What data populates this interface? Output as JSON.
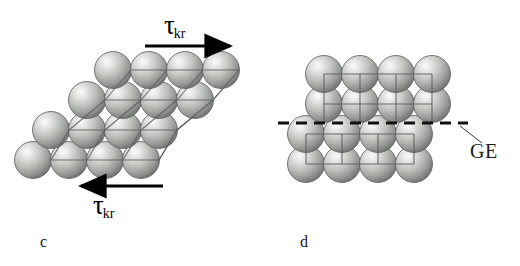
{
  "figure": {
    "background_color": "#ffffff",
    "width": 520,
    "height": 266
  },
  "panels": [
    {
      "id": "c",
      "label": "c",
      "caption_position": "bottom-left",
      "description": "sheared crystal lattice under critical shear stress",
      "arrows": [
        {
          "name": "shear-arrow-top",
          "direction": "right",
          "x1": 145,
          "y1": 46,
          "x2": 235,
          "y2": 46,
          "color": "#000000"
        },
        {
          "name": "shear-arrow-bottom",
          "direction": "left",
          "x1": 163,
          "y1": 186,
          "x2": 76,
          "y2": 186,
          "color": "#000000"
        }
      ],
      "annotations": [
        {
          "name": "tau-top",
          "symbol": "τ",
          "subscript": "kr"
        },
        {
          "name": "tau-bottom",
          "symbol": "τ",
          "subscript": "kr"
        }
      ]
    },
    {
      "id": "d",
      "label": "d",
      "caption_position": "bottom-left",
      "description": "offset lattice halves separated by a grain boundary",
      "annotations": [
        {
          "name": "grain-boundary",
          "label": "GE"
        }
      ],
      "boundary_line": {
        "name": "grain-boundary-line",
        "style": "dashed",
        "x1": 18,
        "y1": 123,
        "x2": 208,
        "y2": 123,
        "color": "#111111"
      },
      "leader_line": {
        "x1": 200,
        "y1": 126,
        "x2": 222,
        "y2": 143
      }
    }
  ],
  "sphere_style": {
    "diameter": 37,
    "highlight_color": "#f2f2f0",
    "mid_color": "#b6b8b4",
    "edge_color": "#6e7070",
    "outline_color": "#5a5c5c"
  },
  "lattice_c": {
    "rows": [
      {
        "index": 0,
        "y": 160,
        "x_start": 33,
        "count": 4,
        "step": 36
      },
      {
        "index": 1,
        "y": 130,
        "x_start": 51,
        "count": 4,
        "step": 36
      },
      {
        "index": 2,
        "y": 100,
        "x_start": 87,
        "count": 4,
        "step": 36
      },
      {
        "index": 3,
        "y": 70,
        "x_start": 113,
        "count": 4,
        "step": 36
      }
    ],
    "grid_color": "#5c5e5e"
  },
  "lattice_d": {
    "rows": [
      {
        "index": 0,
        "y": 164,
        "x_start": 46,
        "count": 4,
        "step": 36
      },
      {
        "index": 1,
        "y": 134,
        "x_start": 46,
        "count": 4,
        "step": 36
      },
      {
        "index": 2,
        "y": 104,
        "x_start": 64,
        "count": 4,
        "step": 36
      },
      {
        "index": 3,
        "y": 74,
        "x_start": 64,
        "count": 4,
        "step": 36
      }
    ],
    "grid_color": "#5c5e5e"
  }
}
